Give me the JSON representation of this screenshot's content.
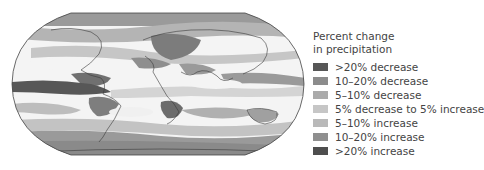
{
  "figure": {
    "type": "choropleth-world-map"
  },
  "legend": {
    "title_line1": "Percent change",
    "title_line2": "in precipitation",
    "items": [
      {
        "label": ">20% decrease",
        "color": "#575757"
      },
      {
        "label": "10–20% decrease",
        "color": "#8c8c8c"
      },
      {
        "label": "5–10% decrease",
        "color": "#ababab"
      },
      {
        "label": "5% decrease to 5% increase",
        "color": "#c6c6c6"
      },
      {
        "label": "5–10% increase",
        "color": "#b9b9b9"
      },
      {
        "label": "10–20% increase",
        "color": "#8f8f8f"
      },
      {
        "label": ">20% increase",
        "color": "#4e4e4e"
      }
    ]
  },
  "map_colors": {
    "outline": "#444444",
    "coast": "#3a3a3a",
    "white": "#f7f7f7",
    "light": "#c9c9c9",
    "mid": "#a5a5a5",
    "dark": "#7a7a7a",
    "darkest": "#555555"
  }
}
